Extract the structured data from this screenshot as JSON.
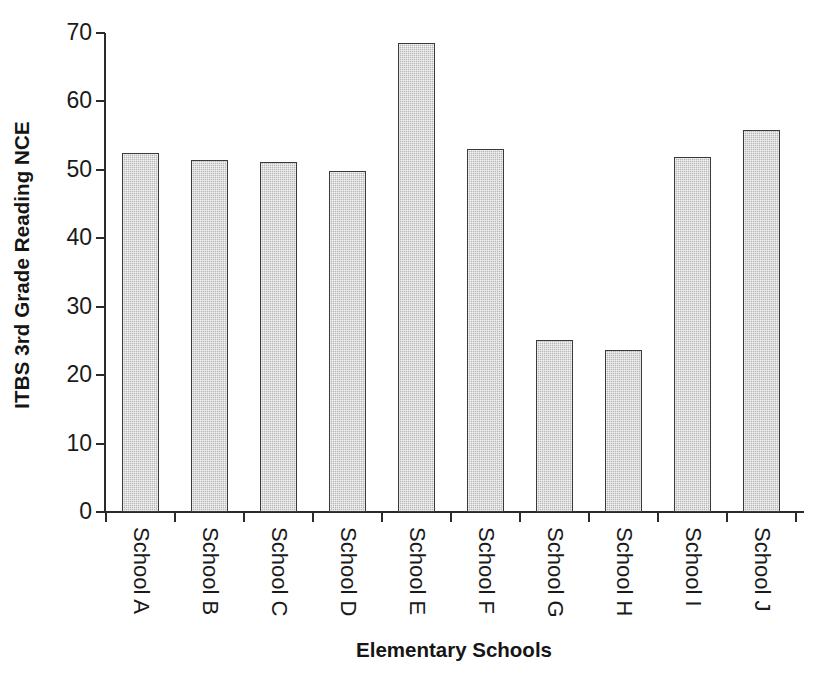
{
  "chart_data": {
    "type": "bar",
    "title": "",
    "xlabel": "Elementary Schools",
    "ylabel": "ITBS 3rd Grade Reading NCE",
    "categories": [
      "School A",
      "School B",
      "School C",
      "School D",
      "School E",
      "School F",
      "School G",
      "School H",
      "School I",
      "School J"
    ],
    "values": [
      52.5,
      51.5,
      51.1,
      49.9,
      68.5,
      53.0,
      25.2,
      23.7,
      51.9,
      55.8
    ],
    "ylim": [
      0,
      70
    ],
    "yticks": [
      0,
      10,
      20,
      30,
      40,
      50,
      60,
      70
    ],
    "ytick_labels": [
      "0",
      "10",
      "20",
      "30",
      "40",
      "50",
      "60",
      "70"
    ],
    "grid": false,
    "legend": null,
    "bar_fill_color": "#c3c3c3",
    "bar_border_color": "#3a3a3a",
    "axis_color": "#2b2b2b",
    "background_color": "#ffffff"
  }
}
